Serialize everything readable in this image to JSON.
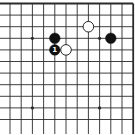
{
  "diagram": {
    "type": "go-board-fragment",
    "visible_edges": [
      "top",
      "right"
    ],
    "columns_visible": 12,
    "rows_visible": 11,
    "colors": {
      "line": "#2a2a2a",
      "black_stone": "#111111",
      "white_stone": "#ffffff",
      "stone_outline": "#111111",
      "label_on_black": "#ffffff"
    },
    "star_points": [
      {
        "col": 2,
        "row": 3
      },
      {
        "col": 8,
        "row": 3
      },
      {
        "col": 2,
        "row": 9
      },
      {
        "col": 8,
        "row": 9
      }
    ],
    "stones": [
      {
        "color": "black",
        "col": 4,
        "row": 3,
        "label": ""
      },
      {
        "color": "black",
        "col": 4,
        "row": 4,
        "label": "1"
      },
      {
        "color": "white",
        "col": 5,
        "row": 4,
        "label": ""
      },
      {
        "color": "white",
        "col": 7,
        "row": 2,
        "label": ""
      },
      {
        "color": "black",
        "col": 9,
        "row": 3,
        "label": ""
      }
    ]
  }
}
